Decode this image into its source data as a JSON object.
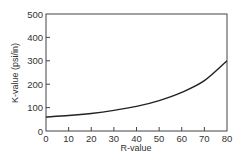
{
  "chart_data": {
    "type": "line",
    "title": "",
    "xlabel": "R-value",
    "ylabel": "K-value (psi/in)",
    "xlim": [
      0,
      80
    ],
    "ylim": [
      0,
      500
    ],
    "x_ticks": [
      0,
      10,
      20,
      30,
      40,
      50,
      60,
      70,
      80
    ],
    "y_ticks": [
      0,
      100,
      200,
      300,
      400,
      500
    ],
    "grid": false,
    "legend": null,
    "series": [
      {
        "name": "K-value vs R-value",
        "x": [
          0,
          10,
          20,
          30,
          40,
          50,
          60,
          70,
          80
        ],
        "y": [
          60,
          66,
          75,
          88,
          105,
          130,
          165,
          215,
          300
        ]
      }
    ]
  },
  "axes": {
    "xlabel": "R-value",
    "ylabel": "K-value (psi/in)"
  }
}
